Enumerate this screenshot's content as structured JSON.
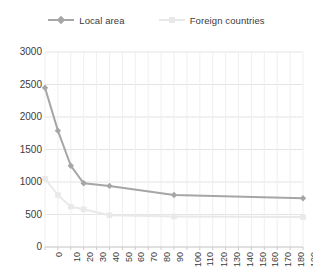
{
  "legend": {
    "position": "top-center",
    "entries": [
      {
        "label": "Local area",
        "color": "#a6a6a6",
        "marker": "diamond"
      },
      {
        "label": "Foreign countries",
        "color": "#e9e9e9",
        "marker": "square"
      }
    ]
  },
  "chart_data": {
    "type": "line",
    "title": "",
    "subtitle": "",
    "xlabel": "",
    "ylabel": "",
    "xlim": [
      0,
      200
    ],
    "ylim": [
      0,
      3000
    ],
    "grid": true,
    "grid_axis": "both",
    "legend_position": "top-center",
    "yticks": [
      0,
      500,
      1000,
      1500,
      2000,
      2500,
      3000
    ],
    "ytick_labels": [
      "0",
      "500",
      "1000",
      "1500",
      "2000",
      "2500",
      "3000"
    ],
    "xticks": [
      0,
      10,
      20,
      30,
      40,
      50,
      60,
      70,
      80,
      90,
      100,
      110,
      120,
      130,
      140,
      150,
      160,
      170,
      180,
      190,
      200
    ],
    "xtick_labels": [
      "0",
      "10",
      "20",
      "30",
      "40",
      "50",
      "60",
      "70",
      "80",
      "90",
      "100",
      "110",
      "120",
      "130",
      "140",
      "150",
      "160",
      "170",
      "180",
      "190",
      "200"
    ],
    "xtick_rotation": 90,
    "series": [
      {
        "name": "Local area",
        "color": "#a6a6a6",
        "marker": "diamond",
        "x": [
          0,
          10,
          20,
          30,
          50,
          100,
          200
        ],
        "values": [
          2450,
          1790,
          1250,
          980,
          940,
          800,
          750
        ]
      },
      {
        "name": "Foreign countries",
        "color": "#e9e9e9",
        "marker": "square",
        "x": [
          0,
          10,
          20,
          30,
          50,
          100,
          200
        ],
        "values": [
          1050,
          800,
          620,
          580,
          490,
          470,
          460
        ]
      }
    ]
  }
}
